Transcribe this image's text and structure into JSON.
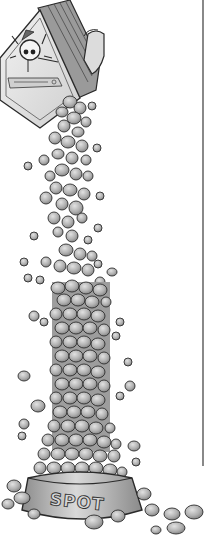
{
  "illustration": {
    "subject": "dog food pouring from a tilted box into a dog bowl",
    "bowl": {
      "label": "SPOT"
    },
    "box": {
      "mascot": "cartoon dog face",
      "label_text_legible": false
    },
    "divider": {
      "orientation": "vertical"
    }
  },
  "colors": {
    "background": "#ffffff",
    "ink": "#2a2a2a",
    "kibble_light": "#cfcfcf",
    "kibble_mid": "#a9a9a9",
    "kibble_dark": "#7a7a7a",
    "box_face": "#e6e6e6",
    "bowl_body": "#bdbdbd",
    "divider": "#3a3a3a"
  }
}
